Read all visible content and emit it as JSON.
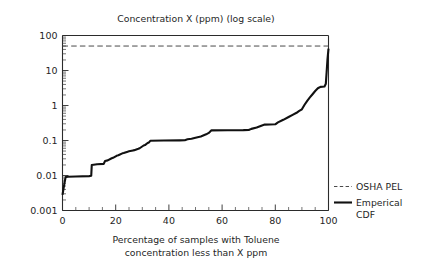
{
  "chart_data": {
    "type": "line",
    "title": "Concentration X (ppm) (log scale)",
    "xlabel": "Percentage of samples with Toluene concentration less than X ppm",
    "xlabel_line1": "Percentage of samples with Toluene",
    "xlabel_line2": "concentration less than X ppm",
    "ylabel": "",
    "yscale": "log",
    "xlim": [
      0,
      100
    ],
    "ylim": [
      0.001,
      100
    ],
    "grid": false,
    "legend_position": "right",
    "xticks": [
      0,
      20,
      40,
      60,
      80,
      100
    ],
    "xtick_labels": [
      "0",
      "20",
      "40",
      "60",
      "80",
      "100"
    ],
    "xtick_minor_step": 5,
    "yticks": [
      0.001,
      0.01,
      0.1,
      1,
      10,
      100
    ],
    "ytick_labels": [
      "0.001",
      "0.01",
      "0.1",
      "1",
      "10",
      "100"
    ],
    "series": [
      {
        "name": "OSHA PEL",
        "style": "dashed",
        "color": "#4a4a4a",
        "constant_value": 50,
        "x": [
          0,
          100
        ],
        "values": [
          50,
          50
        ]
      },
      {
        "name": "Emperical CDF",
        "style": "solid",
        "color": "#111111",
        "x": [
          0.0,
          0.8,
          1.2,
          2.0,
          5.0,
          10.0,
          10.8,
          11.0,
          13.0,
          15.5,
          16.0,
          17.0,
          18.5,
          19.0,
          20.5,
          21.0,
          22.5,
          23.0,
          24.5,
          25.0,
          26.5,
          27.0,
          28.5,
          29.0,
          30.5,
          31.0,
          32.0,
          32.5,
          33.0,
          38.0,
          44.0,
          46.0,
          47.0,
          48.5,
          50.0,
          52.0,
          54.0,
          55.0,
          56.0,
          62.0,
          68.0,
          70.0,
          71.0,
          73.0,
          75.0,
          76.0,
          80.0,
          81.0,
          83.0,
          85.0,
          86.5,
          88.0,
          89.0,
          90.0,
          91.0,
          92.0,
          93.0,
          94.0,
          95.0,
          96.0,
          97.0,
          98.5,
          99.0,
          99.3,
          99.6,
          100.0
        ],
        "values": [
          0.0028,
          0.0065,
          0.009,
          0.0092,
          0.0094,
          0.0096,
          0.0098,
          0.02,
          0.021,
          0.0215,
          0.026,
          0.027,
          0.031,
          0.032,
          0.037,
          0.038,
          0.043,
          0.044,
          0.048,
          0.049,
          0.052,
          0.053,
          0.058,
          0.06,
          0.072,
          0.074,
          0.085,
          0.088,
          0.098,
          0.1,
          0.101,
          0.102,
          0.108,
          0.112,
          0.12,
          0.13,
          0.15,
          0.165,
          0.195,
          0.197,
          0.198,
          0.2,
          0.215,
          0.235,
          0.27,
          0.285,
          0.29,
          0.33,
          0.39,
          0.47,
          0.54,
          0.62,
          0.7,
          0.78,
          1.05,
          1.35,
          1.7,
          2.1,
          2.6,
          3.1,
          3.4,
          3.5,
          4.2,
          9.0,
          20.0,
          42.0
        ]
      }
    ]
  },
  "legend": {
    "items": [
      {
        "label": "OSHA PEL",
        "style": "dashed"
      },
      {
        "label": "Emperical",
        "label2": "CDF",
        "style": "solid"
      }
    ]
  }
}
